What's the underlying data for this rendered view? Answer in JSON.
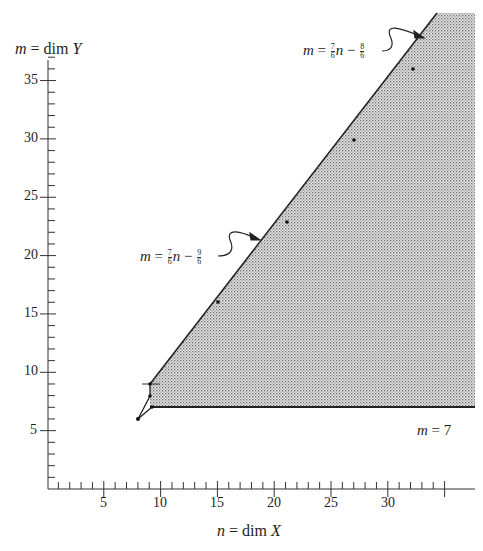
{
  "chart_data": {
    "type": "area",
    "title": "",
    "xlabel": "n = dim X",
    "ylabel": "m = dim Y",
    "xlim": [
      0,
      36
    ],
    "ylim": [
      0,
      37
    ],
    "x_ticks": [
      5,
      10,
      15,
      20,
      25,
      30
    ],
    "y_ticks": [
      5,
      10,
      15,
      20,
      25,
      30,
      35
    ],
    "minor_tick_interval": 1,
    "grid": false,
    "region": {
      "description": "Shaded (stippled) region bounded below by m = 7 and above-left by line m = (7/6)n - (9/6) / (7/6)n - (8/6)",
      "fill": "stippled gray"
    },
    "series": [
      {
        "name": "m = (7/6)n - (9/6)",
        "type": "line",
        "points": [
          [
            9,
            9
          ],
          [
            15,
            16
          ],
          [
            21,
            23
          ],
          [
            27,
            30
          ],
          [
            33,
            37
          ]
        ]
      },
      {
        "name": "m = 7",
        "type": "line",
        "points": [
          [
            9,
            7
          ],
          [
            36,
            7
          ]
        ]
      },
      {
        "name": "initial segments",
        "type": "line",
        "points": [
          [
            8,
            6
          ],
          [
            9,
            8
          ],
          [
            9,
            9
          ]
        ]
      },
      {
        "name": "initial segments lower",
        "type": "line",
        "points": [
          [
            8,
            6
          ],
          [
            9,
            7
          ]
        ]
      }
    ],
    "marked_points": [
      [
        8,
        6
      ],
      [
        9,
        7
      ],
      [
        9,
        8
      ],
      [
        9,
        9
      ],
      [
        15,
        16
      ],
      [
        21,
        23
      ],
      [
        27,
        30
      ],
      [
        32,
        36
      ]
    ],
    "annotations": [
      {
        "text": "m = 7/6 n − 8/6",
        "points_to": "upper segment of boundary line",
        "position": "top-right"
      },
      {
        "text": "m = 7/6 n − 9/6",
        "points_to": "middle segment of boundary line",
        "position": "middle-left"
      },
      {
        "text": "m = 7",
        "position": "below horizontal boundary, right"
      }
    ]
  },
  "labels": {
    "y_axis": {
      "var": "m",
      "eq": " = dim ",
      "set": "Y"
    },
    "x_axis": {
      "var": "n",
      "eq": " = dim ",
      "set": "X"
    },
    "ann_upper": {
      "m": "m",
      "eq": " = ",
      "num": "7",
      "den": "6",
      "n": "n",
      "minus": " − ",
      "cnum": "8",
      "cden": "6"
    },
    "ann_lower": {
      "m": "m",
      "eq": " = ",
      "num": "7",
      "den": "6",
      "n": "n",
      "minus": " − ",
      "cnum": "9",
      "cden": "6"
    },
    "ann_m7": {
      "m": "m",
      "rest": " = 7"
    },
    "x_ticks": [
      "5",
      "10",
      "15",
      "20",
      "25",
      "30"
    ],
    "y_ticks": [
      "35",
      "30",
      "25",
      "20",
      "15",
      "10",
      "5"
    ]
  }
}
